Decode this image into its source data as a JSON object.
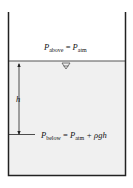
{
  "diagram": {
    "top_label": {
      "var": "P",
      "sub": "above",
      "eq": " = ",
      "rhs_var": "P",
      "rhs_sub": "atm"
    },
    "bottom_label": {
      "var": "P",
      "sub": "below",
      "eq": " = ",
      "rhs_var": "P",
      "rhs_sub": "atm",
      "tail": " + ρgh"
    },
    "depth_label": "h",
    "colors": {
      "wall": "#222222",
      "water": "#f0f0f0",
      "surface": "#555555"
    }
  }
}
